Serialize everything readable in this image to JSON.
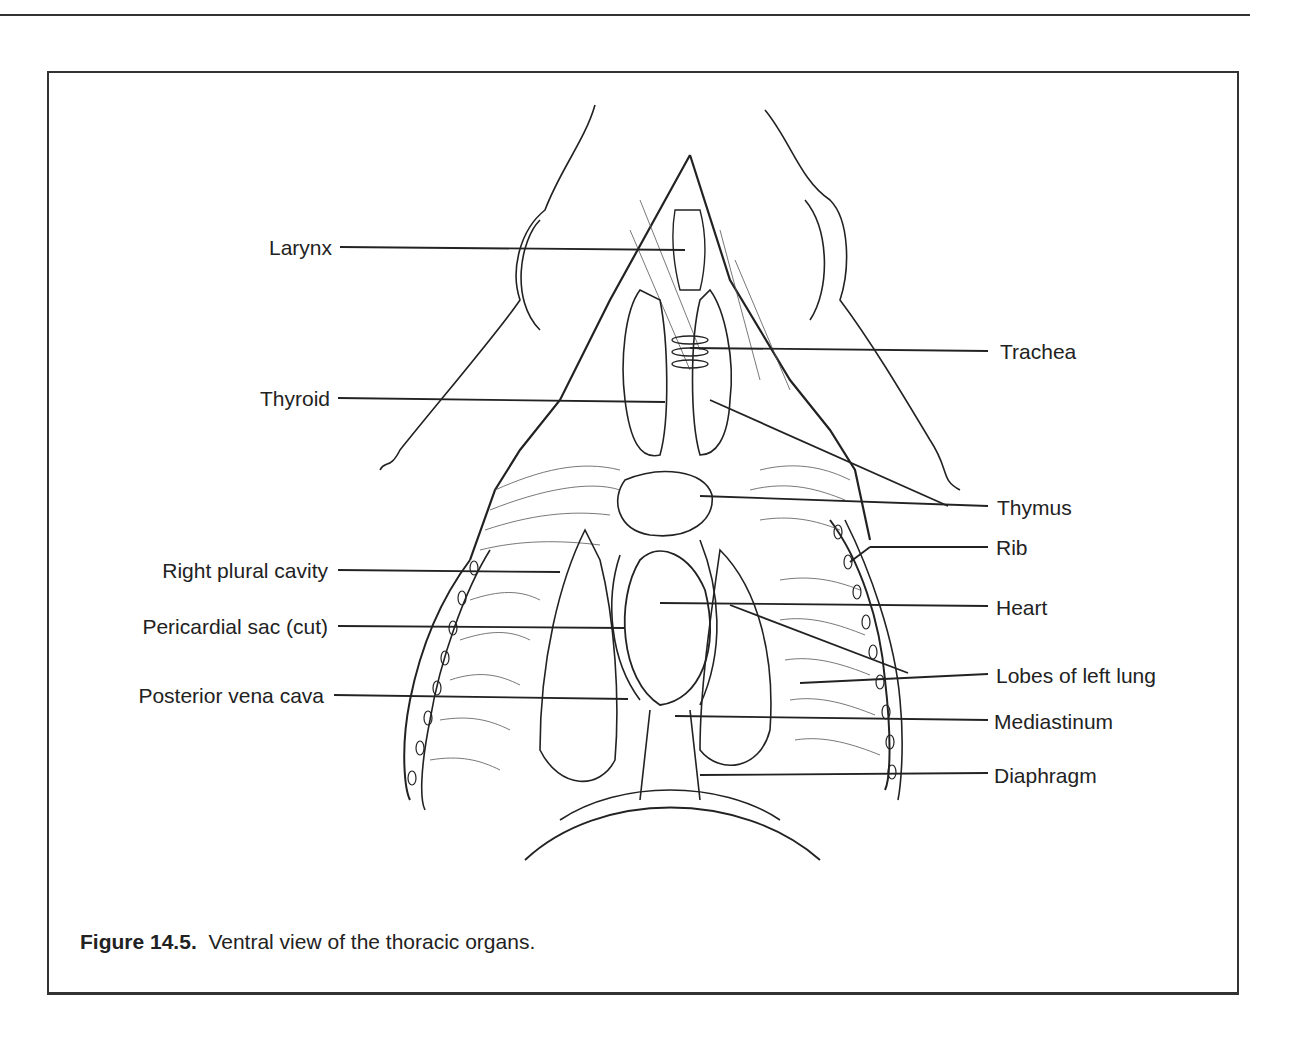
{
  "page": {
    "header_fragment": "g 123"
  },
  "figure": {
    "number": "Figure 14.5.",
    "caption": "Ventral view of the thoracic organs.",
    "left_labels": [
      {
        "text": "Larynx"
      },
      {
        "text": "Thyroid"
      },
      {
        "text": "Right plural cavity"
      },
      {
        "text": "Pericardial sac (cut)"
      },
      {
        "text": "Posterior vena cava"
      }
    ],
    "right_labels": [
      {
        "text": "Trachea"
      },
      {
        "text": "Thymus"
      },
      {
        "text": "Rib"
      },
      {
        "text": "Heart"
      },
      {
        "text": "Lobes of left lung"
      },
      {
        "text": "Mediastinum"
      },
      {
        "text": "Diaphragm"
      }
    ]
  }
}
